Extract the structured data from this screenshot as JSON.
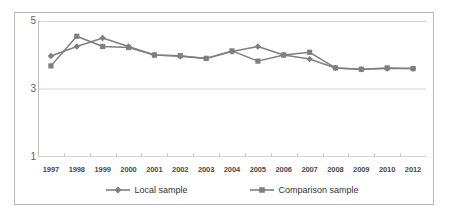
{
  "chart_data": {
    "type": "line",
    "title": "",
    "subtitle": "",
    "xlabel": "",
    "ylabel": "",
    "categories": [
      "1997",
      "1998",
      "1999",
      "2000",
      "2001",
      "2002",
      "2003",
      "2004",
      "2005",
      "2006",
      "2007",
      "2008",
      "2009",
      "2010",
      "2012"
    ],
    "ylim": [
      1,
      5
    ],
    "yticks": [
      1,
      3,
      5
    ],
    "ytick_labels": [
      "1",
      "3",
      "5"
    ],
    "grid": true,
    "grid_axis": "y",
    "legend_position": "bottom",
    "series": [
      {
        "name": "Local sample",
        "marker": "diamond",
        "color": "#7f7f7f",
        "values": [
          3.97,
          4.25,
          4.5,
          4.25,
          4.0,
          3.96,
          3.9,
          4.1,
          4.25,
          4.0,
          3.88,
          3.62,
          3.58,
          3.6,
          3.6
        ]
      },
      {
        "name": "Comparison sample",
        "marker": "square",
        "color": "#7f7f7f",
        "values": [
          3.68,
          4.55,
          4.25,
          4.22,
          4.0,
          3.98,
          3.9,
          4.12,
          3.82,
          4.0,
          4.08,
          3.62,
          3.58,
          3.62,
          3.6
        ]
      }
    ]
  },
  "axis": {
    "y_ticks": [
      "5",
      "3",
      "1"
    ],
    "x_ticks": [
      "1997",
      "1998",
      "1999",
      "2000",
      "2001",
      "2002",
      "2003",
      "2004",
      "2005",
      "2006",
      "2007",
      "2008",
      "2009",
      "2010",
      "2012"
    ]
  },
  "legend": {
    "items": [
      {
        "label": "Local sample",
        "marker": "diamond-marker-icon",
        "color": "#7f7f7f"
      },
      {
        "label": "Comparison sample",
        "marker": "square-marker-icon",
        "color": "#7f7f7f"
      }
    ]
  },
  "style": {
    "series_color": "#7f7f7f",
    "grid_color": "#d4d4d4",
    "frame_color": "#b9b9b9",
    "axis_text_color": "#4a4a4a"
  }
}
